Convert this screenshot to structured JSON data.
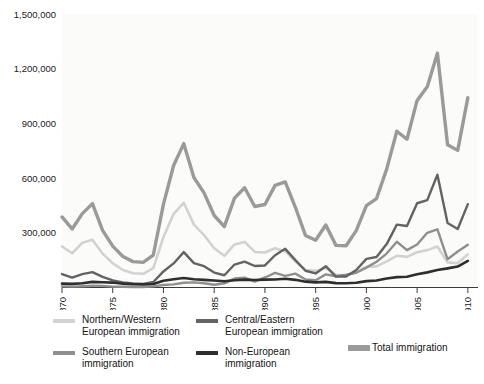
{
  "chart_data": {
    "type": "line",
    "title": "",
    "subtitle": "",
    "xlabel": "",
    "ylabel": "",
    "xlim": [
      1870,
      1911
    ],
    "ylim": [
      0,
      1500000
    ],
    "grid": false,
    "legend_position": "below-plot",
    "y_ticks": [
      {
        "value": 1500000,
        "label": "1,500,000"
      },
      {
        "value": 1200000,
        "label": "1,200,000"
      },
      {
        "value": 900000,
        "label": "900,000"
      },
      {
        "value": 600000,
        "label": "600,000"
      },
      {
        "value": 300000,
        "label": "300,000"
      }
    ],
    "x_ticks": [
      {
        "value": 1870,
        "label": "1870"
      },
      {
        "value": 1875,
        "label": "1875"
      },
      {
        "value": 1880,
        "label": "1880"
      },
      {
        "value": 1885,
        "label": "1885"
      },
      {
        "value": 1890,
        "label": "1890"
      },
      {
        "value": 1895,
        "label": "1895"
      },
      {
        "value": 1900,
        "label": "1900"
      },
      {
        "value": 1905,
        "label": "1905"
      },
      {
        "value": 1910,
        "label": "1910"
      }
    ],
    "x": [
      1870,
      1871,
      1872,
      1873,
      1874,
      1875,
      1876,
      1877,
      1878,
      1879,
      1880,
      1881,
      1882,
      1883,
      1884,
      1885,
      1886,
      1887,
      1888,
      1889,
      1890,
      1891,
      1892,
      1893,
      1894,
      1895,
      1896,
      1897,
      1898,
      1899,
      1900,
      1901,
      1902,
      1903,
      1904,
      1905,
      1906,
      1907,
      1908,
      1909,
      1910
    ],
    "series": [
      {
        "name": "Total immigration",
        "color": "#9a9a9a",
        "width": 3.4,
        "values": [
          387000,
          321000,
          405000,
          460000,
          313000,
          227000,
          170000,
          142000,
          138000,
          178000,
          457000,
          669000,
          789000,
          603000,
          519000,
          395000,
          334000,
          490000,
          547000,
          444000,
          455000,
          560000,
          579000,
          440000,
          285000,
          259000,
          343000,
          231000,
          229000,
          312000,
          449000,
          488000,
          649000,
          857000,
          813000,
          1026000,
          1101000,
          1285000,
          783000,
          752000,
          1041000
        ]
      },
      {
        "name": "Northern/Western European immigration",
        "color": "#d2d2d2",
        "width": 2.6,
        "values": [
          225000,
          188000,
          245000,
          262000,
          186000,
          133000,
          96000,
          78000,
          75000,
          106000,
          277000,
          403000,
          465000,
          345000,
          287000,
          215000,
          174000,
          236000,
          250000,
          195000,
          192000,
          215000,
          199000,
          143000,
          96000,
          91000,
          107000,
          70000,
          66000,
          85000,
          113000,
          116000,
          143000,
          174000,
          168000,
          193000,
          205000,
          225000,
          138000,
          133000,
          182000
        ]
      },
      {
        "name": "Southern European immigration",
        "color": "#8f8f8f",
        "width": 2.4,
        "values": [
          6000,
          5000,
          7000,
          10000,
          9000,
          5000,
          4000,
          3000,
          3000,
          6000,
          14000,
          17000,
          26000,
          28000,
          23000,
          15000,
          23000,
          49000,
          54000,
          32000,
          55000,
          80000,
          64000,
          76000,
          44000,
          40000,
          72000,
          62000,
          70000,
          81000,
          109000,
          141000,
          186000,
          251000,
          205000,
          236000,
          300000,
          319000,
          155000,
          197000,
          234000
        ]
      },
      {
        "name": "Central/Eastern European immigration",
        "color": "#636363",
        "width": 2.4,
        "values": [
          74000,
          54000,
          73000,
          84000,
          58000,
          39000,
          28000,
          22000,
          20000,
          30000,
          88000,
          132000,
          194000,
          134000,
          117000,
          82000,
          67000,
          126000,
          142000,
          118000,
          121000,
          177000,
          212000,
          150000,
          92000,
          77000,
          117000,
          60000,
          60000,
          96000,
          157000,
          167000,
          238000,
          345000,
          337000,
          462000,
          479000,
          618000,
          354000,
          321000,
          457000
        ]
      },
      {
        "name": "Non-European immigration",
        "color": "#2e2e2e",
        "width": 2.6,
        "values": [
          21000,
          20000,
          23000,
          31000,
          29000,
          27000,
          21000,
          18000,
          17000,
          19000,
          37000,
          45000,
          52000,
          45000,
          42000,
          38000,
          34000,
          40000,
          43000,
          41000,
          43000,
          44000,
          48000,
          42000,
          32000,
          28000,
          31000,
          24000,
          23000,
          26000,
          35000,
          38000,
          49000,
          57000,
          59000,
          73000,
          83000,
          96000,
          105000,
          115000,
          146000
        ]
      }
    ]
  },
  "legend": {
    "columns": [
      {
        "entries": [
          {
            "label": "Northern/Western\nEuropean immigration",
            "color": "#d2d2d2",
            "icon": "legend-swatch-northern-western"
          },
          {
            "label": "Southern European\nimmigration",
            "color": "#8f8f8f",
            "icon": "legend-swatch-southern"
          }
        ]
      },
      {
        "entries": [
          {
            "label": "Central/Eastern\nEuropean immigration",
            "color": "#636363",
            "icon": "legend-swatch-central-eastern"
          },
          {
            "label": "Non-European\nimmigration",
            "color": "#2e2e2e",
            "icon": "legend-swatch-non-european"
          }
        ]
      },
      {
        "entries": [
          {
            "label": "Total immigration",
            "color": "#9a9a9a",
            "icon": "legend-swatch-total"
          }
        ]
      }
    ]
  }
}
